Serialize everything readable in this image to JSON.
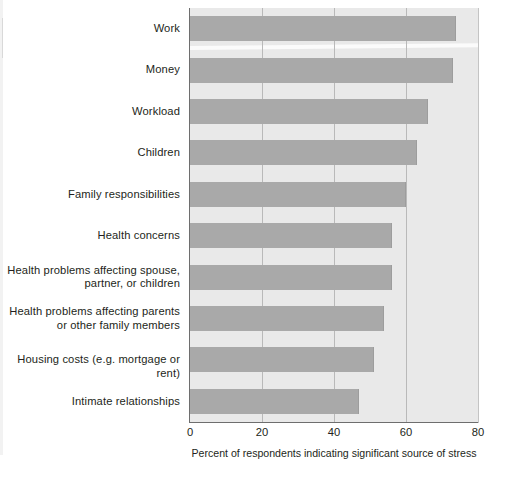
{
  "chart_data": {
    "type": "bar",
    "orientation": "horizontal",
    "title": "",
    "subtitle": "",
    "xlabel": "Percent of respondents indicating significant source of stress",
    "ylabel": "",
    "xlim": [
      0,
      80
    ],
    "xticks": [
      0,
      20,
      40,
      60,
      80
    ],
    "xtick_labels": [
      "0",
      "20",
      "40",
      "60",
      "80"
    ],
    "grid": true,
    "grid_axis": "x",
    "legend": null,
    "categories": [
      "Work",
      "Money",
      "Workload",
      "Children",
      "Family responsibilities",
      "Health concerns",
      "Health problems affecting spouse,\npartner, or children",
      "Health problems affecting parents\nor other family members",
      "Housing costs (e.g. mortgage or rent)",
      "Intimate relationships"
    ],
    "values": [
      74,
      73,
      66,
      63,
      60,
      56,
      56,
      54,
      51,
      47
    ],
    "colors": {
      "bar": "#a9a9a9",
      "plot_background": "#e9e9e9",
      "gridline": "#b9b9b9",
      "axis": "#6e6e6e",
      "text": "#231f20",
      "page_background": "#ffffff"
    }
  },
  "axis": {
    "x_title": "Percent of respondents indicating significant source of stress",
    "ticks": [
      {
        "label": "0",
        "value": 0
      },
      {
        "label": "20",
        "value": 20
      },
      {
        "label": "40",
        "value": 40
      },
      {
        "label": "60",
        "value": 60
      },
      {
        "label": "80",
        "value": 80
      }
    ]
  }
}
